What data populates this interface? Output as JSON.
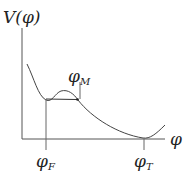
{
  "diagram": {
    "type": "potential-energy-curve",
    "y_axis_label": "V(φ)",
    "x_axis_label": "φ",
    "points": {
      "false_vacuum": {
        "symbol": "φ",
        "sub": "F"
      },
      "maximum": {
        "symbol": "φ",
        "sub": "M"
      },
      "true_vacuum": {
        "symbol": "φ",
        "sub": "T"
      }
    },
    "colors": {
      "line": "#333333",
      "text": "#222222"
    }
  }
}
